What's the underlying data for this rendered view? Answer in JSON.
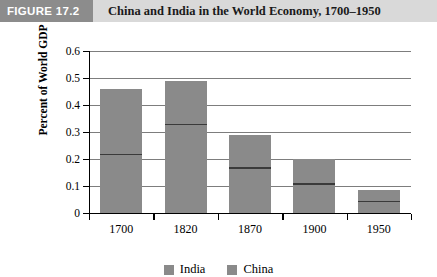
{
  "header": {
    "badge": "FIGURE 17.2",
    "title": "China and India in the World Economy, 1700–1950",
    "badge_color": "#8c8c8c",
    "banner_color": "#d9d9d9"
  },
  "chart_data": {
    "type": "bar",
    "subtype": "stacked",
    "title": "China and India in the World Economy, 1700–1950",
    "xlabel": "",
    "ylabel": "Percent of World GDP",
    "categories": [
      "1700",
      "1820",
      "1870",
      "1900",
      "1950"
    ],
    "series": [
      {
        "name": "India",
        "values": [
          0.22,
          0.33,
          0.17,
          0.11,
          0.045
        ],
        "color": "#8a8a8a"
      },
      {
        "name": "China",
        "values": [
          0.24,
          0.16,
          0.12,
          0.09,
          0.04
        ],
        "color": "#8a8a8a"
      }
    ],
    "totals": [
      0.46,
      0.49,
      0.29,
      0.2,
      0.085
    ],
    "ylim": [
      0,
      0.6
    ],
    "yticks": [
      "0",
      "0.1",
      "0.2",
      "0.3",
      "0.4",
      "0.5",
      "0.6"
    ],
    "ytick_values": [
      0,
      0.1,
      0.2,
      0.3,
      0.4,
      0.5,
      0.6
    ],
    "grid": true,
    "legend_position": "bottom",
    "legend": [
      "India",
      "China"
    ]
  }
}
